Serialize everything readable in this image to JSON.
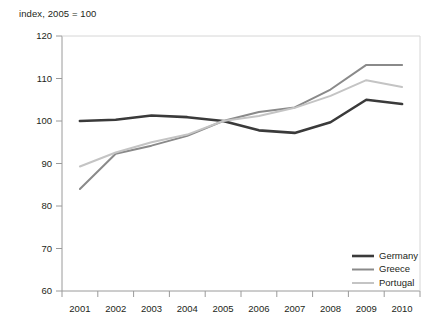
{
  "chart_data": {
    "type": "line",
    "title": "index, 2005 = 100",
    "xlabel": "",
    "ylabel": "",
    "ylim": [
      60,
      120
    ],
    "ytick_step": 10,
    "grid": false,
    "legend_position": "bottom-right",
    "categories": [
      "2001",
      "2002",
      "2003",
      "2004",
      "2005",
      "2006",
      "2007",
      "2008",
      "2009",
      "2010"
    ],
    "series": [
      {
        "name": "Germany",
        "color": "#3a3a3a",
        "width": 2.6,
        "values": [
          100.0,
          100.3,
          101.3,
          100.9,
          100.0,
          97.8,
          97.2,
          99.7,
          105.0,
          104.0
        ]
      },
      {
        "name": "Greece",
        "color": "#8a8a8a",
        "width": 2.0,
        "values": [
          84.0,
          92.3,
          94.2,
          96.5,
          100.0,
          102.1,
          103.2,
          107.4,
          113.2,
          113.2
        ]
      },
      {
        "name": "Portugal",
        "color": "#c4c4c4",
        "width": 2.0,
        "values": [
          89.3,
          92.6,
          95.0,
          96.8,
          100.0,
          101.2,
          103.1,
          105.9,
          109.6,
          108.0
        ]
      }
    ],
    "ytick_labels": [
      "120",
      "110",
      "100",
      "90",
      "80",
      "70",
      "60"
    ],
    "xtick_labels": [
      "2001",
      "2002",
      "2003",
      "2004",
      "2005",
      "2006",
      "2007",
      "2008",
      "2009",
      "2010"
    ]
  },
  "legend": {
    "items": [
      {
        "label": "Germany"
      },
      {
        "label": "Greece"
      },
      {
        "label": "Portugal"
      }
    ]
  }
}
